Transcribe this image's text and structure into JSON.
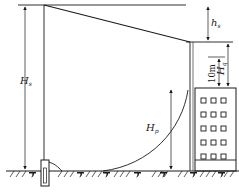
{
  "diagram": {
    "title": "",
    "colors": {
      "line": "#1a1a1a",
      "background": "#ffffff"
    },
    "labels": {
      "H_s": {
        "main": "H",
        "sub": "s"
      },
      "h_s": {
        "main": "h",
        "sub": "s"
      },
      "H_q": {
        "main": "H",
        "sub": "q"
      },
      "H_p": {
        "main": "H",
        "sub": "p"
      },
      "ten_m": "10m"
    },
    "building": {
      "window_rows": 5,
      "window_cols": 3
    },
    "elements": [
      "ground-line",
      "water-tower-pole",
      "supply-pipe-slope",
      "riser-pipe",
      "building",
      "fire-hydrant",
      "pressure-curve"
    ]
  }
}
